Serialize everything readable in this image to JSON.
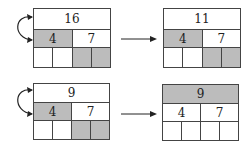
{
  "colors": {
    "shade": "#bcbcbc",
    "line": "#444444",
    "background": "#ffffff"
  },
  "diagrams": [
    {
      "before": {
        "top": "16",
        "mid_left": "4",
        "mid_right": "7",
        "top_shaded": false,
        "mid_left_shaded": true,
        "mid_right_shaded": false,
        "bottom_cells_shaded": [
          false,
          false,
          true,
          true
        ]
      },
      "after": {
        "top": "11",
        "mid_left": "4",
        "mid_right": "7",
        "top_shaded": false,
        "mid_left_shaded": true,
        "mid_right_shaded": false,
        "bottom_cells_shaded": [
          false,
          false,
          true,
          true
        ]
      },
      "swap_arrow": "curved-double-arrow",
      "transition_arrow": "right-arrow"
    },
    {
      "before": {
        "top": "9",
        "mid_left": "4",
        "mid_right": "7",
        "top_shaded": false,
        "mid_left_shaded": true,
        "mid_right_shaded": false,
        "bottom_cells_shaded": [
          false,
          false,
          true,
          true
        ]
      },
      "after": {
        "top": "9",
        "mid_left": "4",
        "mid_right": "7",
        "top_shaded": true,
        "mid_left_shaded": false,
        "mid_right_shaded": false,
        "bottom_cells_shaded": [
          false,
          false,
          false,
          false
        ]
      },
      "swap_arrow": "curved-double-arrow",
      "transition_arrow": "right-arrow"
    }
  ]
}
